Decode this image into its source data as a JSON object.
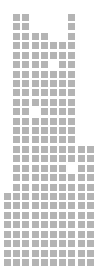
{
  "chart_data": {
    "type": "heatmap",
    "subtype": "waffle-grid",
    "title": "",
    "xlabel": "",
    "ylabel": "",
    "grid": false,
    "legend": null,
    "columns": 10,
    "rows": 27,
    "cell_color": "#b4b4b4",
    "background_color": "#ffffff",
    "filled_columns_by_row": [
      [
        1,
        2,
        7
      ],
      [
        1,
        2,
        7
      ],
      [
        1,
        2,
        3,
        4,
        7
      ],
      [
        1,
        2,
        3,
        4,
        5,
        6,
        7
      ],
      [
        1,
        2,
        3,
        4,
        5,
        6,
        7
      ],
      [
        1,
        2,
        3,
        4,
        6,
        7
      ],
      [
        1,
        2,
        3,
        4,
        5,
        6,
        7
      ],
      [
        1,
        2,
        3,
        4,
        5,
        6,
        7
      ],
      [
        1,
        2,
        3,
        4,
        5,
        6,
        7
      ],
      [
        1,
        2,
        3,
        4,
        5,
        6,
        7
      ],
      [
        1,
        2,
        4,
        5,
        6,
        7
      ],
      [
        1,
        2,
        3,
        4,
        5,
        6,
        7
      ],
      [
        1,
        2,
        3,
        4,
        5,
        6,
        7
      ],
      [
        1,
        2,
        3,
        4,
        5,
        6,
        7
      ],
      [
        1,
        2,
        3,
        4,
        5,
        6,
        7,
        8,
        9
      ],
      [
        1,
        2,
        3,
        4,
        5,
        6,
        7,
        8,
        9
      ],
      [
        1,
        2,
        3,
        4,
        5,
        6,
        8,
        9
      ],
      [
        1,
        2,
        3,
        4,
        5,
        6,
        7,
        8,
        9
      ],
      [
        1,
        2,
        3,
        4,
        5,
        6,
        7,
        8,
        9
      ],
      [
        0,
        1,
        2,
        3,
        4,
        5,
        6,
        7,
        8,
        9
      ],
      [
        0,
        1,
        2,
        3,
        4,
        5,
        6,
        7,
        8,
        9
      ],
      [
        0,
        1,
        2,
        3,
        4,
        5,
        6,
        7,
        8,
        9
      ],
      [
        0,
        1,
        2,
        3,
        4,
        5,
        6,
        7,
        8,
        9
      ],
      [
        0,
        1,
        2,
        3,
        4,
        5,
        6,
        7,
        8,
        9
      ],
      [
        0,
        1,
        2,
        3,
        4,
        5,
        6,
        7,
        8,
        9
      ],
      [
        0,
        1,
        2,
        3,
        4,
        5,
        6,
        7,
        8,
        9
      ],
      [
        0,
        1,
        2,
        3,
        4,
        5,
        6,
        7,
        8,
        9
      ]
    ],
    "cells_per_row": [
      3,
      3,
      5,
      7,
      7,
      6,
      7,
      7,
      7,
      7,
      6,
      7,
      7,
      7,
      9,
      9,
      8,
      9,
      9,
      10,
      10,
      10,
      10,
      10,
      10,
      10,
      10
    ]
  }
}
